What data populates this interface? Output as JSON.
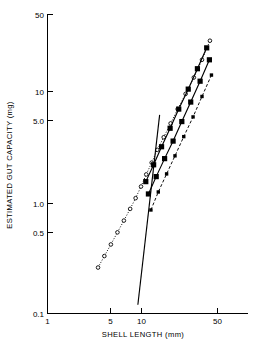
{
  "chart_data": {
    "type": "scatter",
    "title": "",
    "xlabel": "SHELL LENGTH (mm)",
    "ylabel": "ESTIMATED GUT CAPACITY (mg)",
    "xscale": "log",
    "yscale": "log",
    "xlim": [
      1,
      100
    ],
    "ylim": [
      0.1,
      50
    ],
    "grid": false,
    "legend": "none",
    "x_ticks": [
      {
        "value": 1,
        "label": "1"
      },
      {
        "value": 5,
        "label": "5"
      },
      {
        "value": 10,
        "label": "10"
      },
      {
        "value": 50,
        "label": "50"
      }
    ],
    "y_ticks": [
      {
        "value": 0.1,
        "label": "0.1"
      },
      {
        "value": 0.5,
        "label": "0.5"
      },
      {
        "value": 1.0,
        "label": "1.0"
      },
      {
        "value": 5.0,
        "label": "5.0"
      },
      {
        "value": 10,
        "label": "10"
      },
      {
        "value": 50,
        "label": "50"
      }
    ],
    "series": [
      {
        "name": "series-open-circle-dotted",
        "style": "dotted",
        "marker": "open-circle",
        "x": [
          3.2,
          3.7,
          4.3,
          5.0,
          5.8,
          6.7,
          7.6,
          8.6,
          9.7,
          11.0,
          12.5,
          14.5,
          17.0,
          20.0,
          24.0,
          29.0,
          35.0,
          42.0
        ],
        "y": [
          0.26,
          0.33,
          0.42,
          0.54,
          0.69,
          0.88,
          1.1,
          1.4,
          1.8,
          2.3,
          3.0,
          3.9,
          5.2,
          7.0,
          9.6,
          13.5,
          19.5,
          29.0
        ]
      },
      {
        "name": "series-filled-square-solid-upper",
        "style": "solid",
        "marker": "filled-square",
        "x": [
          9.6,
          11.5,
          13.8,
          16.8,
          20.5,
          25.5,
          31.5,
          39.0
        ],
        "y": [
          1.55,
          2.2,
          3.2,
          4.7,
          7.0,
          10.6,
          16.2,
          25.0
        ]
      },
      {
        "name": "series-filled-square-solid-lower",
        "style": "solid",
        "marker": "filled-square",
        "x": [
          10.2,
          12.2,
          14.8,
          18.0,
          22.0,
          27.0,
          33.5,
          41.5
        ],
        "y": [
          1.2,
          1.72,
          2.5,
          3.6,
          5.4,
          8.1,
          12.5,
          19.5
        ]
      },
      {
        "name": "series-small-filled-dashed",
        "style": "dashed",
        "marker": "small-filled-square",
        "x": [
          10.8,
          12.8,
          15.5,
          18.8,
          23.0,
          28.5,
          35.0,
          43.5
        ],
        "y": [
          0.86,
          1.25,
          1.82,
          2.65,
          3.95,
          5.95,
          9.1,
          14.2
        ]
      },
      {
        "name": "series-plain-solid-steep",
        "style": "solid",
        "marker": "none",
        "x": [
          8.0,
          13.2
        ],
        "y": [
          0.12,
          6.2
        ]
      }
    ]
  }
}
